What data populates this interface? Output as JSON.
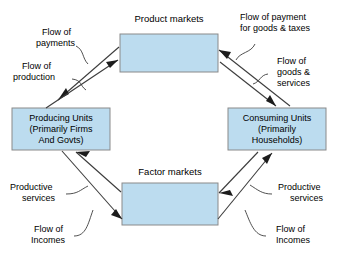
{
  "diagram": {
    "colors": {
      "box_fill": "#bcdcef",
      "box_stroke": "#8a8a8a",
      "line": "#3c3c3c",
      "text": "#000000",
      "background": "#ffffff"
    },
    "markets": {
      "product": {
        "title": "Product markets"
      },
      "factor": {
        "title": "Factor markets"
      }
    },
    "entities": {
      "producing": {
        "line1": "Producing Units",
        "line2": "(Primarily Firms",
        "line3": "And Govts)"
      },
      "consuming": {
        "line1": "Consuming Units",
        "line2": "(Primarily",
        "line3": "Households)"
      }
    },
    "flow_labels": {
      "payments": {
        "line1": "Flow of",
        "line2": "payments"
      },
      "production": {
        "line1": "Flow of",
        "line2": "production"
      },
      "payment_goods_taxes": {
        "line1": "Flow of payment",
        "line2": "for goods & taxes"
      },
      "goods_services": {
        "line1": "Flow of",
        "line2": "goods &",
        "line3": "services"
      },
      "productive_services_left": {
        "line1": "Productive",
        "line2": "services"
      },
      "incomes_left": {
        "line1": "Flow of",
        "line2": "Incomes"
      },
      "productive_services_right": {
        "line1": "Productive",
        "line2": "services"
      },
      "incomes_right": {
        "line1": "Flow of",
        "line2": "Incomes"
      }
    }
  }
}
